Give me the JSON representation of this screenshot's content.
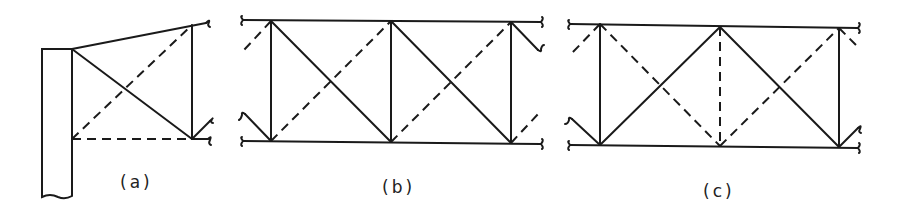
{
  "figure": {
    "panels": [
      {
        "id": "a",
        "label": "(a)",
        "description": "Cantilever bracing panel attached to a column, with solid and dashed diagonals"
      },
      {
        "id": "b",
        "label": "(b)",
        "description": "Truss with parallel chords, verticals, solid diagonals descending right and dashed diagonals ascending right"
      },
      {
        "id": "c",
        "label": "(c)",
        "description": "Truss with parallel chords, alternating solid and dashed diagonals forming X patterns, dashed central vertical"
      }
    ],
    "legend": {
      "solid": "member (solid line)",
      "dashed": "member (dashed line)"
    },
    "colors": {
      "line": "#1a1a1a",
      "background": "#ffffff"
    }
  }
}
